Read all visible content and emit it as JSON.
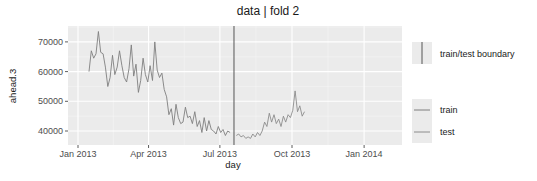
{
  "chart_data": {
    "type": "line",
    "title": "data | fold 2",
    "xlabel": "day",
    "ylabel": "ahead.3",
    "x_ticks": [
      "Jan 2013",
      "Apr 2013",
      "Jul 2013",
      "Oct 2013",
      "Jan 2014"
    ],
    "y_ticks": [
      40000,
      50000,
      60000,
      70000
    ],
    "ylim": [
      36500,
      75000
    ],
    "xlim": [
      "2012-12-14",
      "2014-02-15"
    ],
    "grid": true,
    "legend_position": "right",
    "boundary": {
      "label": "train/test boundary",
      "date": "2013-07-19"
    },
    "series": [
      {
        "name": "train",
        "color": "#7f7f7f",
        "x": [
          "2013-01-15",
          "2013-01-18",
          "2013-01-21",
          "2013-01-24",
          "2013-01-27",
          "2013-01-30",
          "2013-02-02",
          "2013-02-05",
          "2013-02-08",
          "2013-02-11",
          "2013-02-14",
          "2013-02-17",
          "2013-02-20",
          "2013-02-23",
          "2013-02-26",
          "2013-03-01",
          "2013-03-04",
          "2013-03-07",
          "2013-03-10",
          "2013-03-13",
          "2013-03-16",
          "2013-03-19",
          "2013-03-22",
          "2013-03-25",
          "2013-03-28",
          "2013-03-31",
          "2013-04-03",
          "2013-04-06",
          "2013-04-09",
          "2013-04-12",
          "2013-04-15",
          "2013-04-18",
          "2013-04-21",
          "2013-04-24",
          "2013-04-27",
          "2013-04-30",
          "2013-05-03",
          "2013-05-06",
          "2013-05-09",
          "2013-05-12",
          "2013-05-15",
          "2013-05-18",
          "2013-05-21",
          "2013-05-24",
          "2013-05-27",
          "2013-05-30",
          "2013-06-02",
          "2013-06-05",
          "2013-06-08",
          "2013-06-11",
          "2013-06-14",
          "2013-06-17",
          "2013-06-20",
          "2013-06-23",
          "2013-06-26",
          "2013-06-29",
          "2013-07-02",
          "2013-07-05",
          "2013-07-08",
          "2013-07-11",
          "2013-07-14"
        ],
        "values": [
          60000,
          67000,
          64500,
          66000,
          73500,
          66500,
          66000,
          61500,
          55000,
          58000,
          65500,
          59000,
          61500,
          67000,
          62000,
          58000,
          56500,
          61000,
          69000,
          58500,
          62500,
          53000,
          57000,
          64500,
          59000,
          56500,
          62000,
          57000,
          70000,
          60500,
          58000,
          59500,
          54000,
          51500,
          45500,
          47500,
          42000,
          49000,
          44500,
          42500,
          43000,
          48000,
          44500,
          45000,
          42500,
          46500,
          41500,
          43500,
          39500,
          44500,
          40000,
          43500,
          40500,
          40000,
          39000,
          41500,
          39500,
          40500,
          38500,
          40000,
          39500
        ]
      },
      {
        "name": "test",
        "color": "#8c8c8c",
        "x": [
          "2013-07-22",
          "2013-07-25",
          "2013-07-28",
          "2013-07-31",
          "2013-08-03",
          "2013-08-06",
          "2013-08-09",
          "2013-08-12",
          "2013-08-15",
          "2013-08-18",
          "2013-08-21",
          "2013-08-24",
          "2013-08-27",
          "2013-08-30",
          "2013-09-02",
          "2013-09-05",
          "2013-09-08",
          "2013-09-11",
          "2013-09-14",
          "2013-09-17",
          "2013-09-20",
          "2013-09-23",
          "2013-09-26",
          "2013-09-29",
          "2013-10-02",
          "2013-10-05",
          "2013-10-08",
          "2013-10-11",
          "2013-10-14",
          "2013-10-17"
        ],
        "values": [
          38500,
          39000,
          38000,
          38500,
          37500,
          38000,
          37500,
          39000,
          38000,
          39500,
          38500,
          40000,
          43000,
          41500,
          46000,
          43000,
          45500,
          42500,
          44000,
          41500,
          45000,
          43000,
          45500,
          44500,
          47000,
          53500,
          46500,
          48500,
          45000,
          46500
        ]
      }
    ]
  },
  "legend": {
    "boundary_label": "train/test boundary",
    "train_label": "train",
    "test_label": "test"
  }
}
